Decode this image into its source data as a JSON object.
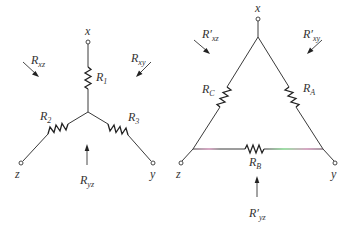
{
  "figure": {
    "wye": {
      "terminals": [
        {
          "id": "x",
          "label": "x"
        },
        {
          "id": "z",
          "label": "z"
        },
        {
          "id": "y",
          "label": "y"
        }
      ],
      "resistors": [
        {
          "id": "R1",
          "base": "R",
          "sub": "1"
        },
        {
          "id": "R2",
          "base": "R",
          "sub": "2"
        },
        {
          "id": "R3",
          "base": "R",
          "sub": "3"
        }
      ],
      "equivalent_resistances": [
        {
          "id": "Rxz",
          "base": "R",
          "sub": "xz"
        },
        {
          "id": "Rxy",
          "base": "R",
          "sub": "xy"
        },
        {
          "id": "Ryz",
          "base": "R",
          "sub": "yz"
        }
      ]
    },
    "delta": {
      "terminals": [
        {
          "id": "x",
          "label": "x"
        },
        {
          "id": "z",
          "label": "z"
        },
        {
          "id": "y",
          "label": "y"
        }
      ],
      "resistors": [
        {
          "id": "RC",
          "base": "R",
          "sub": "C"
        },
        {
          "id": "RA",
          "base": "R",
          "sub": "A"
        },
        {
          "id": "RB",
          "base": "R",
          "sub": "B"
        }
      ],
      "equivalent_resistances": [
        {
          "id": "Rxz_p",
          "base": "R′",
          "sub": "xz"
        },
        {
          "id": "Rxy_p",
          "base": "R′",
          "sub": "xy"
        },
        {
          "id": "Ryz_p",
          "base": "R′",
          "sub": "yz"
        }
      ]
    },
    "colors": {
      "wire": "#3a3a3a",
      "bottom_tint_magenta": "#b0508a",
      "bottom_tint_green": "#3fbf4f"
    }
  }
}
